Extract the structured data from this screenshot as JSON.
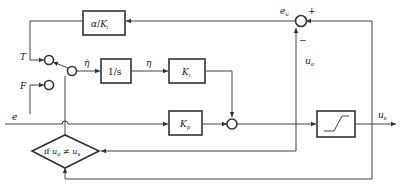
{
  "diagram": {
    "inputs": {
      "T": "T",
      "F": "F",
      "e": "e"
    },
    "blocks": {
      "feedback_gain": {
        "num": "α",
        "slash": "/",
        "den": "K",
        "den_sub": "i"
      },
      "integrator": "1/s",
      "integral_gain": {
        "label": "K",
        "sub": "i"
      },
      "proportional_gain": {
        "label": "K",
        "sub": "p"
      },
      "saturation": "saturation",
      "condition": {
        "prefix": "if ",
        "left": "u",
        "left_sub": "a",
        "op": " ≠ ",
        "right": "u",
        "right_sub": "s"
      }
    },
    "signals": {
      "eta_dot": "η̇",
      "eta": "η",
      "e_u": {
        "label": "e",
        "sub": "u"
      },
      "u_a": {
        "label": "u",
        "sub": "a"
      },
      "u_s": {
        "label": "u",
        "sub": "s"
      }
    },
    "signs": {
      "plus": "+",
      "minus": "−"
    }
  }
}
